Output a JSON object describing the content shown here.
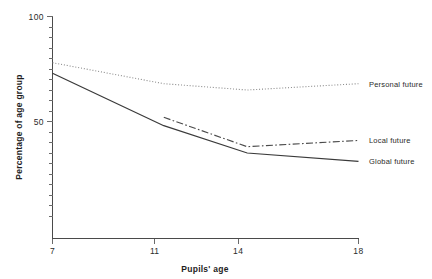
{
  "chart_data": {
    "type": "line",
    "title": "",
    "subtitle": "",
    "xlabel": "Pupils' age",
    "ylabel": "Percentage of age group",
    "x": [
      7,
      11,
      14,
      18
    ],
    "xticklabels": [
      "7",
      "11",
      "14",
      "18"
    ],
    "yticklabels": [
      "100",
      "50"
    ],
    "ytickvalues": [
      100,
      50
    ],
    "yminorticks": [
      95,
      90,
      85,
      80,
      75,
      70,
      65,
      60,
      55,
      45,
      40,
      35,
      30,
      25,
      20,
      15,
      10,
      5
    ],
    "xlim": [
      7,
      18
    ],
    "ylim": [
      0,
      100
    ],
    "grid": false,
    "legend_position": "right-inline-labels",
    "series": [
      {
        "name": "Personal future",
        "style": "dotted",
        "color": "#8a8a8a",
        "x": [
          7,
          11,
          14,
          18
        ],
        "values": [
          78,
          68,
          65,
          68
        ]
      },
      {
        "name": "Local future",
        "style": "dash-dot",
        "color": "#4a4a4a",
        "x": [
          11,
          14,
          18
        ],
        "values": [
          52,
          38,
          41
        ]
      },
      {
        "name": "Global future",
        "style": "solid",
        "color": "#3a3a3a",
        "x": [
          7,
          11,
          14,
          18
        ],
        "values": [
          73,
          48,
          35,
          31
        ]
      }
    ]
  },
  "labels": {
    "y_axis_title": "Percentage of age group",
    "x_axis_title": "Pupils' age",
    "y_tick_100": "100",
    "y_tick_50": "50",
    "x_tick_7": "7",
    "x_tick_11": "11",
    "x_tick_14": "14",
    "x_tick_18": "18",
    "series_personal": "Personal future",
    "series_local": "Local future",
    "series_global": "Global future"
  },
  "colors": {
    "axis": "#4a4a4a",
    "text": "#2b2b2b",
    "personal": "#8a8a8a",
    "local": "#4a4a4a",
    "global": "#3a3a3a",
    "background": "#ffffff"
  }
}
